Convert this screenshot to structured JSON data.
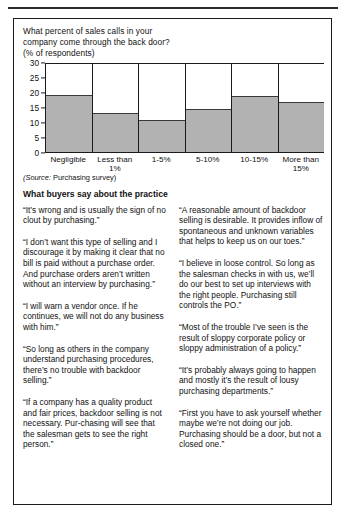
{
  "chart_data": {
    "type": "bar",
    "title_lines": [
      "What percent of sales calls in your",
      "company come through the back door?",
      "(% of respondents)"
    ],
    "categories": [
      "Negligible",
      "Less than 1%",
      "1-5%",
      "5-10%",
      "10-15%",
      "More than 15%"
    ],
    "category_lines": [
      [
        "Negligible"
      ],
      [
        "Less than",
        "1%"
      ],
      [
        "1-5%"
      ],
      [
        "5-10%"
      ],
      [
        "10-15%"
      ],
      [
        "More than",
        "15%"
      ]
    ],
    "values": [
      19,
      13,
      10.5,
      14.3,
      18.7,
      16.7
    ],
    "xlabel": "",
    "ylabel": "",
    "ylim": [
      0,
      30
    ],
    "yticks": [
      0,
      5,
      10,
      15,
      20,
      25,
      30
    ],
    "grid": false,
    "legend": false,
    "bar_color": "#b2b2b2",
    "axis_color": "#1a1a1a"
  },
  "source": {
    "prefix": "(Source:",
    "text": "Purchasing survey)"
  },
  "section": {
    "heading": "What buyers say about the practice"
  },
  "quotes": {
    "left": [
      "“It’s wrong and is usually the sign of no clout by purchasing.”",
      "“I don’t want this type of selling and I discourage it by making it clear that no bill is paid without a purchase order. And purchase orders aren’t written without an interview by purchasing.”",
      "“I will warn a vendor once.  If he continues, we will not do any business with him.”",
      "“So long as others in the company understand purchasing procedures, there’s no trouble with backdoor selling.”",
      "“If a company has a quality product and fair prices, backdoor selling is not necessary.  Pur-chasing will see that the salesman gets to see the right person.”"
    ],
    "right": [
      "“A reasonable amount of backdoor selling is desirable. It provides inflow of spontaneous and unknown variables that helps to keep us on our toes.”",
      "“I believe in loose control.  So long as the salesman checks in with us, we’ll do our best to set up interviews with the right people.  Purchasing still controls the PO.”",
      "“Most of the trouble I’ve seen is the result of sloppy corporate policy or sloppy administration of a policy.”",
      "“It’s probably always going to happen and mostly it’s the result of lousy purchasing departments.”",
      "“First you have to ask yourself whether maybe we’re not doing our job.  Purchasing should be a door, but not a closed one.”"
    ]
  }
}
